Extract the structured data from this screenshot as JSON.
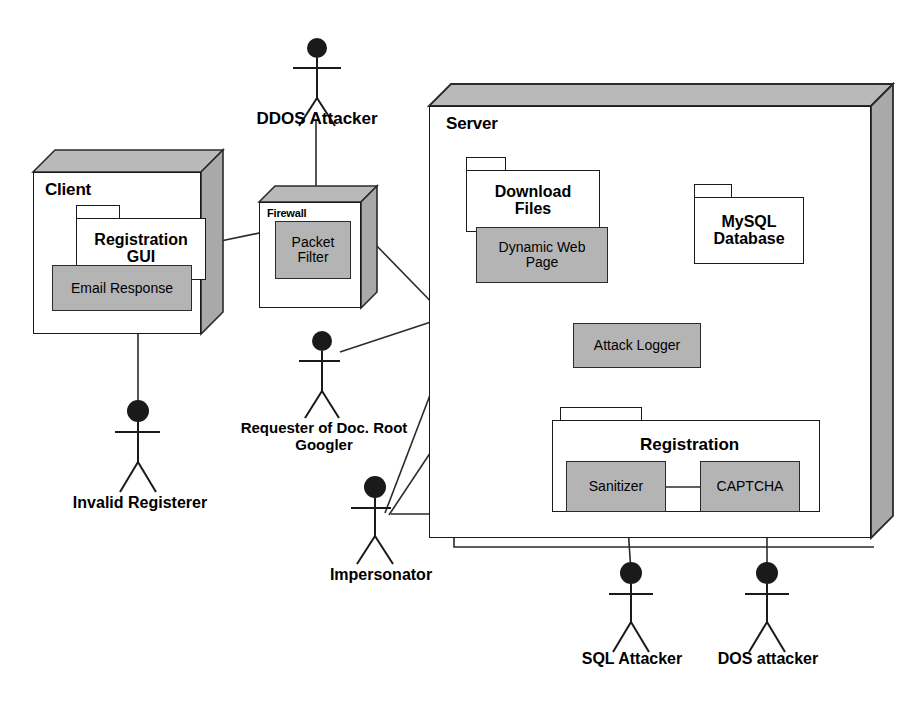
{
  "diagram": {
    "colors": {
      "component_fill": "#b4b4b4",
      "node_fill": "#ffffff",
      "node_top_fill": "#b9b9b9",
      "node_side_fill": "#a9a9a9",
      "line": "#1a1a1a"
    }
  },
  "nodes": {
    "client": {
      "label": "Client"
    },
    "firewall": {
      "label": "Firewall"
    },
    "server": {
      "label": "Server"
    }
  },
  "packages": {
    "registration_gui": {
      "label": "Registration\nGUI"
    },
    "download_files": {
      "label": "Download\nFiles"
    },
    "mysql_database": {
      "label": "MySQL\nDatabase"
    },
    "registration": {
      "label": "Registration"
    }
  },
  "components": {
    "email_response": {
      "label": "Email Response"
    },
    "packet_filter": {
      "label": "Packet\nFilter"
    },
    "dynamic_web_page": {
      "label": "Dynamic Web\nPage"
    },
    "attack_logger": {
      "label": "Attack Logger"
    },
    "sanitizer": {
      "label": "Sanitizer"
    },
    "captcha": {
      "label": "CAPTCHA"
    }
  },
  "actors": [
    {
      "id": "ddos_attacker",
      "label": "DDOS Attacker"
    },
    {
      "id": "requester_googler",
      "label": "Requester of Doc. Root\nGoogler"
    },
    {
      "id": "invalid_registerer",
      "label": "Invalid Registerer"
    },
    {
      "id": "impersonator",
      "label": "Impersonator"
    },
    {
      "id": "sql_attacker",
      "label": "SQL Attacker"
    },
    {
      "id": "dos_attacker",
      "label": "DOS attacker"
    }
  ]
}
